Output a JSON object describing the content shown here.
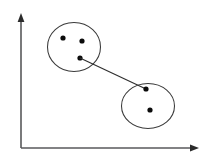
{
  "figure": {
    "width": 210,
    "height": 166,
    "background_color": "#ffffff"
  },
  "colors": {
    "axis": "#58595b",
    "axis_arrow": "#2b2b2b",
    "ellipse_stroke": "#3a3a3a",
    "link_stroke": "#2e2e2e",
    "point_fill": "#0b0b0b"
  },
  "axes": {
    "origin": {
      "x": 21,
      "y": 148
    },
    "y_axis": {
      "label": "",
      "x": 21,
      "y_top": 18,
      "y_bottom": 148,
      "arrow": "up-arrow"
    },
    "x_axis": {
      "label": "",
      "y": 148,
      "x_left": 21,
      "x_right": 198,
      "arrow": "right-arrow"
    },
    "tick_labels_x": [],
    "tick_labels_y": [],
    "grid": false
  },
  "chart_data": {
    "type": "scatter",
    "title": "",
    "xlabel": "",
    "ylabel": "",
    "xlim": [
      0,
      210
    ],
    "ylim": [
      0,
      166
    ],
    "grid": false,
    "legend": null,
    "clusters": [
      {
        "name": "cluster-a",
        "label": "",
        "ellipse": {
          "cx": 74,
          "cy": 47,
          "rx": 26.5,
          "ry": 24.5,
          "rotation": 0
        },
        "points": [
          {
            "id": "a1",
            "x": 63,
            "y": 38
          },
          {
            "id": "a2",
            "x": 82,
            "y": 41
          },
          {
            "id": "a3",
            "x": 80,
            "y": 58
          }
        ]
      },
      {
        "name": "cluster-b",
        "label": "",
        "ellipse": {
          "cx": 148,
          "cy": 106,
          "rx": 26.5,
          "ry": 22.5,
          "rotation": 0
        },
        "points": [
          {
            "id": "b1",
            "x": 146,
            "y": 89
          },
          {
            "id": "b2",
            "x": 150,
            "y": 110
          }
        ]
      }
    ],
    "links": [
      {
        "name": "nearest-neighbor-link",
        "from": "a3",
        "from_x": 80,
        "from_y": 58,
        "to": "b1",
        "to_x": 146,
        "to_y": 89
      }
    ],
    "point_radius": 2.6
  }
}
